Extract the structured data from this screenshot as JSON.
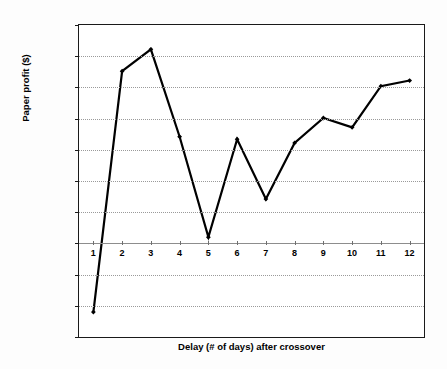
{
  "chart_data": {
    "type": "line",
    "title": "",
    "xlabel": "Delay (# of days) after crossover",
    "ylabel": "Paper profit ($)",
    "x": [
      1,
      2,
      3,
      4,
      5,
      6,
      7,
      8,
      9,
      10,
      11,
      12
    ],
    "values": [
      -11000,
      27600,
      31100,
      17100,
      1000,
      16700,
      7100,
      16100,
      20100,
      18600,
      25200,
      26100
    ],
    "series": [
      {
        "name": "Paper profit",
        "values": [
          -11000,
          27600,
          31100,
          17100,
          1000,
          16700,
          7100,
          16100,
          20100,
          18600,
          25200,
          26100
        ]
      }
    ],
    "xlim": [
      0.5,
      12.5
    ],
    "ylim": [
      -15000,
      35000
    ],
    "ytick_labels": [
      "35000",
      "30000",
      "25000",
      "20000",
      "15000",
      "10000",
      "5000",
      "0",
      "-5000",
      "-10000",
      "-15000"
    ],
    "ytick_values": [
      35000,
      30000,
      25000,
      20000,
      15000,
      10000,
      5000,
      0,
      -5000,
      -10000,
      -15000
    ],
    "xtick_labels": [
      "1",
      "2",
      "3",
      "4",
      "5",
      "6",
      "7",
      "8",
      "9",
      "10",
      "11",
      "12"
    ],
    "xtick_values": [
      1,
      2,
      3,
      4,
      5,
      6,
      7,
      8,
      9,
      10,
      11,
      12
    ],
    "grid": true,
    "grid_axis": "y",
    "legend": false,
    "legend_position": "none",
    "line_color": "#000000",
    "marker": "diamond",
    "marker_color": "#000000",
    "plot_background": "#ffffff",
    "figure_background": "#fdfdfd",
    "axis_color": "#1a1a1a",
    "gridline_color": "#9a9a9a",
    "zeroline_color": "#8d8d8d"
  }
}
